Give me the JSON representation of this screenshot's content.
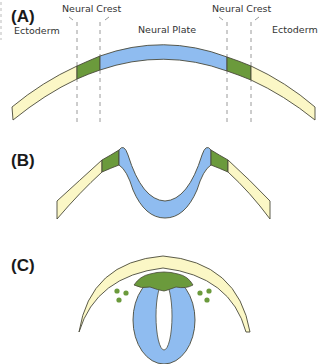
{
  "colors": {
    "ectoderm": "#fbf7c6",
    "neural_crest": "#6b9a3c",
    "neural_plate": "#8fbcf0",
    "outline": "#4a4a3a",
    "dashed_line": "#9a9a9a",
    "lumen": "#ffffff"
  },
  "panels": [
    {
      "id": "A",
      "label": "(A)",
      "tissue_labels": {
        "ectoderm_left": "Ectoderm",
        "neural_crest_left": "Neural Crest",
        "neural_plate": "Neural Plate",
        "neural_crest_right": "Neural Crest",
        "ectoderm_right": "Ectoderm"
      }
    },
    {
      "id": "B",
      "label": "(B)"
    },
    {
      "id": "C",
      "label": "(C)"
    }
  ]
}
